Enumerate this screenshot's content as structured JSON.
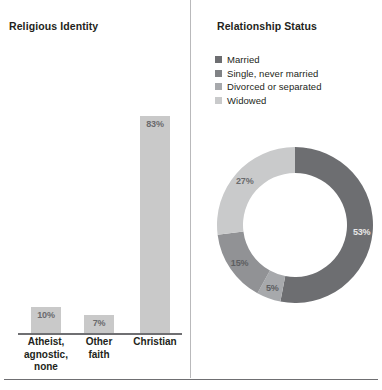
{
  "bar_panel": {
    "title": "Religious Identity"
  },
  "donut_panel": {
    "title": "Relationship Status"
  },
  "footer": {
    "note": ""
  },
  "chart_data": [
    {
      "type": "bar",
      "title": "Religious Identity",
      "xlabel": "",
      "ylabel": "",
      "ylim": [
        0,
        100
      ],
      "grid": false,
      "categories": [
        "Atheist, agnostic, none",
        "Other faith",
        "Christian"
      ],
      "category_lines": [
        [
          "Atheist,",
          "agnostic,",
          "none"
        ],
        [
          "Other",
          "faith"
        ],
        [
          "Christian"
        ]
      ],
      "values": [
        10,
        7,
        83
      ],
      "data_labels": [
        "10%",
        "7%",
        "83%"
      ],
      "bar_color": "#c9c9c9",
      "label_color": "#6a6a6d",
      "axis_color": "#6f6f72"
    },
    {
      "type": "pie",
      "title": "Relationship Status",
      "legend_position": "top",
      "donut": true,
      "labels": [
        "Married",
        "Single, never married",
        "Divorced or separated",
        "Widowed"
      ],
      "values": [
        53,
        5,
        15,
        27
      ],
      "data_labels": [
        "53%",
        "5%",
        "15%",
        "27%"
      ],
      "colors": [
        "#6d6e71",
        "#a7a9ac",
        "#919295",
        "#c9cacb"
      ],
      "legend_colors": [
        "#6d6e71",
        "#808285",
        "#a7a9ac",
        "#c9cacb"
      ],
      "label_text_colors": [
        "#e8e8e8",
        "#5d5e61",
        "#5d5e61",
        "#6a6a6d"
      ]
    }
  ]
}
